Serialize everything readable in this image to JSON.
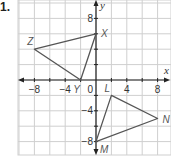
{
  "problem_label": "1.",
  "grid": {
    "origin_px": [
      96,
      80
    ],
    "px_per_unit": 7.7,
    "minor_step": 2,
    "x_range": [
      -10,
      10
    ],
    "y_range": [
      -10,
      10
    ],
    "grid_color": "#cfcfcf",
    "axis_color": "#222222",
    "shape_color": "#555555"
  },
  "axes": {
    "x_label": "x",
    "y_label": "y",
    "x_ticks": [
      {
        "value": -8,
        "label": "−8"
      },
      {
        "value": -4,
        "label": "−4"
      },
      {
        "value": 4,
        "label": "4"
      },
      {
        "value": 8,
        "label": "8"
      }
    ],
    "y_ticks": [
      {
        "value": 8,
        "label": "8"
      },
      {
        "value": -4,
        "label": "−4"
      },
      {
        "value": -8,
        "label": "−8"
      }
    ],
    "origin_label": "0"
  },
  "shapes": [
    {
      "name": "triangle-XYZ",
      "vertices": [
        {
          "label": "X",
          "x": 0,
          "y": 6
        },
        {
          "label": "Y",
          "x": -2,
          "y": 0
        },
        {
          "label": "Z",
          "x": -8,
          "y": 4
        }
      ]
    },
    {
      "name": "triangle-LMN",
      "vertices": [
        {
          "label": "L",
          "x": 2,
          "y": -2
        },
        {
          "label": "M",
          "x": 0,
          "y": -8
        },
        {
          "label": "N",
          "x": 8,
          "y": -5
        }
      ]
    }
  ]
}
